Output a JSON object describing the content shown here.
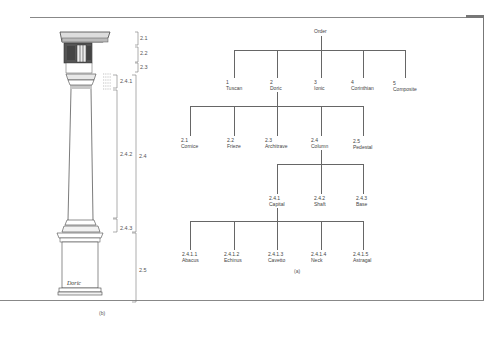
{
  "figure": {
    "caption_a": "(a)",
    "caption_b": "(b)",
    "signature": "Doric"
  },
  "tree": {
    "root": {
      "label": "Order"
    },
    "orders": [
      {
        "num": "1",
        "name": "Tuscan"
      },
      {
        "num": "2",
        "name": "Doric"
      },
      {
        "num": "3",
        "name": "Ionic"
      },
      {
        "num": "4",
        "name": "Corinthian"
      },
      {
        "num": "5",
        "name": "Composite"
      }
    ],
    "doric_parts": [
      {
        "num": "2.1",
        "name": "Cornice"
      },
      {
        "num": "2.2",
        "name": "Frieze"
      },
      {
        "num": "2.3",
        "name": "Architrave"
      },
      {
        "num": "2.4",
        "name": "Column"
      },
      {
        "num": "2.5",
        "name": "Pedestal"
      }
    ],
    "column_parts": [
      {
        "num": "2.4.1",
        "name": "Capital"
      },
      {
        "num": "2.4.2",
        "name": "Shaft"
      },
      {
        "num": "2.4.3",
        "name": "Base"
      }
    ],
    "capital_parts": [
      {
        "num": "2.4.1.1",
        "name": "Abacus"
      },
      {
        "num": "2.4.1.2",
        "name": "Echinus"
      },
      {
        "num": "2.4.1.3",
        "name": "Cavetto"
      },
      {
        "num": "2.4.1.4",
        "name": "Neck"
      },
      {
        "num": "2.4.1.5",
        "name": "Astragal"
      }
    ]
  },
  "column_dimensions": {
    "d21": "2.1",
    "d22": "2.2",
    "d23": "2.3",
    "d241": "2.4.1",
    "d242": "2.4.2",
    "d24": "2.4",
    "d243": "2.4.3",
    "d25": "2.5"
  }
}
